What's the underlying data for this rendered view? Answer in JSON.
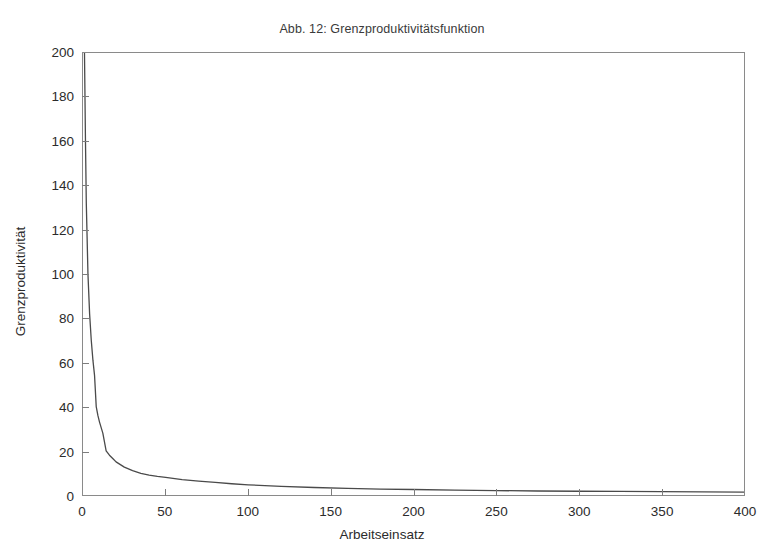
{
  "figure": {
    "title": "Abb. 12: Grenzproduktivitätsfunktion",
    "background_color": "#ffffff",
    "axis_color": "#8a8a8a",
    "curve_color": "#4a4a4a"
  },
  "chart_data": {
    "type": "line",
    "title": "Abb. 12: Grenzproduktivitätsfunktion",
    "xlabel": "Arbeitseinsatz",
    "ylabel": "Grenzproduktivität",
    "xlim": [
      0,
      400
    ],
    "ylim": [
      0,
      200
    ],
    "xticks": [
      0,
      50,
      100,
      150,
      200,
      250,
      300,
      350,
      400
    ],
    "yticks": [
      0,
      20,
      40,
      60,
      80,
      100,
      120,
      140,
      160,
      180,
      200
    ],
    "grid": false,
    "legend": null,
    "series": [
      {
        "name": "Grenzproduktivität",
        "x": [
          0.9,
          1.5,
          2,
          3,
          4,
          5,
          6,
          7,
          8,
          9,
          10,
          12,
          14,
          16,
          18,
          20,
          25,
          30,
          35,
          40,
          45,
          50,
          60,
          70,
          80,
          90,
          100,
          120,
          140,
          160,
          180,
          200,
          225,
          250,
          275,
          300,
          325,
          350,
          375,
          400
        ],
        "y": [
          200,
          160,
          132,
          100,
          82,
          70,
          61,
          54,
          40,
          36,
          33,
          28,
          20,
          18,
          16.5,
          15,
          12.6,
          11,
          9.8,
          9,
          8.4,
          8,
          7,
          6.3,
          5.7,
          5.1,
          4.6,
          3.9,
          3.4,
          3,
          2.7,
          2.5,
          2.2,
          2,
          1.8,
          1.7,
          1.6,
          1.5,
          1.4,
          1.3
        ]
      }
    ]
  },
  "axes": {
    "x_tick_labels": [
      "0",
      "50",
      "100",
      "150",
      "200",
      "250",
      "300",
      "350",
      "400"
    ],
    "y_tick_labels": [
      "0",
      "20",
      "40",
      "60",
      "80",
      "100",
      "120",
      "140",
      "160",
      "180",
      "200"
    ],
    "x_axis_title": "Arbeitseinsatz",
    "y_axis_title": "Grenzproduktivität"
  }
}
